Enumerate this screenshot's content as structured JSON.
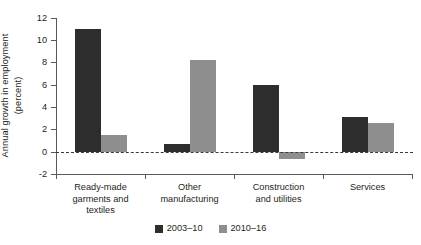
{
  "chart_data": {
    "type": "bar",
    "title": "",
    "subtitle": "",
    "xlabel": "",
    "ylabel": "Annual growth in employment\n(percent)",
    "categories": [
      "Ready-made\ngarments and\ntextiles",
      "Other\nmanufacturing",
      "Construction\nand utilities",
      "Services"
    ],
    "series": [
      {
        "name": "2003–10",
        "color": "#2d2d2d",
        "values": [
          11.0,
          0.7,
          6.0,
          3.1
        ]
      },
      {
        "name": "2010–16",
        "color": "#8e8e8e",
        "values": [
          1.5,
          8.2,
          -0.6,
          2.6
        ]
      }
    ],
    "ylim": [
      -2,
      12
    ],
    "yticks": [
      -2,
      0,
      2,
      4,
      6,
      8,
      10,
      12
    ],
    "ytick_labels": [
      "-2",
      "0",
      "2",
      "4",
      "6",
      "8",
      "10",
      "12"
    ],
    "grid": false,
    "zero_reference_line": true,
    "legend_position": "bottom-center"
  },
  "axis": {
    "y_title_line1": "Annual growth in employment",
    "y_title_line2": "(percent)",
    "y_title": "Annual growth in employment\n(percent)"
  },
  "ytick_labels": {
    "t12": "12",
    "t10": "10",
    "t8": "8",
    "t6": "6",
    "t4": "4",
    "t2": "2",
    "t0": "0",
    "tm2": "-2"
  },
  "categories": {
    "c0": "Ready-made\ngarments and\ntextiles",
    "c1": "Other\nmanufacturing",
    "c2": "Construction\nand utilities",
    "c3": "Services"
  },
  "legend": {
    "items": [
      {
        "label": "2003–10",
        "color": "#2d2d2d"
      },
      {
        "label": "2010–16",
        "color": "#8e8e8e"
      }
    ]
  },
  "colors": {
    "series_dark": "#2d2d2d",
    "series_light": "#8e8e8e",
    "axis": "#58595b",
    "text": "#231f20",
    "background": "#ffffff"
  }
}
